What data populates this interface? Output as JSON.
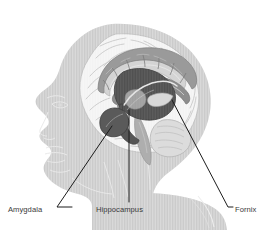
{
  "page": {
    "background_color": "#ffffff",
    "width": 267,
    "height": 230,
    "header_faint_text": " "
  },
  "figure": {
    "name": "limbic-system-illustration",
    "view": "left-facing mid-sagittal profile of human head",
    "style": "grayscale medical illustration with fine vertical hatching",
    "colors": {
      "head_silhouette": "#c8c8c8",
      "head_silhouette_light": "#d6d6d6",
      "brain_cortex": "#f0f0f0",
      "brain_outline": "#b9b9b9",
      "cingulate_band": "#9a9a9a",
      "corpus_callosum": "#d2d2d2",
      "hippocampus": "#4f4f4f",
      "amygdala": "#5a5a5a",
      "fornix": "#8d8d8d",
      "brainstem": "#a5a5a5",
      "leader_line": "#1a1a1a",
      "label_text": "#3a3a3a"
    }
  },
  "labels": [
    {
      "id": "amygdala",
      "text": "Amygdala",
      "position": "bottom-left",
      "leader": "diagonal up-right to the dark almond-shaped amygdala"
    },
    {
      "id": "hippocampus",
      "text": "Hippocampus",
      "position": "bottom-center",
      "leader": "vertical up to the dark curved hippocampus"
    },
    {
      "id": "fornix",
      "text": "Fornix",
      "position": "bottom-right",
      "leader": "diagonal up-left to the arching fornix"
    }
  ]
}
